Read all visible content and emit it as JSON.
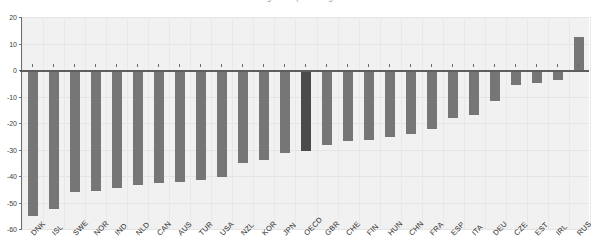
{
  "chart_data": {
    "type": "bar",
    "title": "Change in ... percentage ... ",
    "xlabel": "",
    "ylabel": "",
    "ylim": [
      -60,
      20
    ],
    "yticks": [
      20,
      10,
      0,
      -10,
      -20,
      -30,
      -40,
      -50,
      -60
    ],
    "ytick_labels": [
      "20",
      "10",
      "0",
      "-10",
      "-20",
      "-30",
      "-40",
      "-50",
      "-60"
    ],
    "grid": true,
    "legend": "none",
    "highlight_category": "OECD",
    "categories": [
      "DNK",
      "ISL",
      "SWE",
      "NOR",
      "IND",
      "NLD",
      "CAN",
      "AUS",
      "TUR",
      "USA",
      "NZL",
      "KOR",
      "JPN",
      "OECD",
      "GBR",
      "CHE",
      "FIN",
      "HUN",
      "CHN",
      "FRA",
      "ESP",
      "ITA",
      "DEU",
      "CZE",
      "EST",
      "IRL",
      "RUS"
    ],
    "values": [
      -55.0,
      -52.5,
      -46.0,
      -45.8,
      -44.5,
      -43.5,
      -42.5,
      -42.3,
      -41.5,
      -40.5,
      -35.0,
      -33.8,
      -31.5,
      -30.5,
      -28.3,
      -26.8,
      -26.5,
      -25.3,
      -24.3,
      -22.3,
      -18.2,
      -17.0,
      -11.7,
      -5.5,
      -4.8,
      -3.7,
      12.5
    ]
  },
  "colors": {
    "bar": "#767676",
    "bar_highlight": "#4b4b4b",
    "plot_background": "#f1f1f1",
    "axis": "#6f6f6f",
    "grid": "#e4e4e4",
    "text": "#2e2e2e"
  }
}
